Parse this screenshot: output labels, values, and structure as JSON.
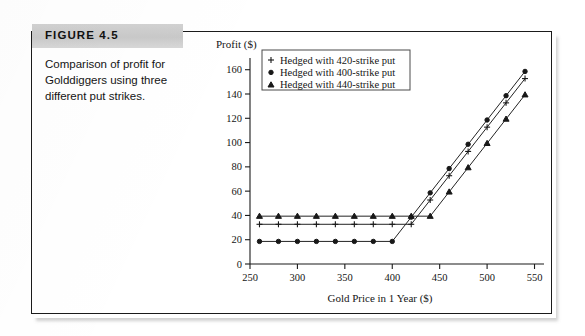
{
  "figure": {
    "number_label": "FIGURE 4.5",
    "caption": "Comparison of profit for Golddiggers using three different put strikes."
  },
  "chart_data": {
    "type": "line",
    "title": "",
    "ylabel": "Profit ($)",
    "xlabel": "Gold Price in 1 Year ($)",
    "xlim": [
      250,
      560
    ],
    "ylim": [
      0,
      168
    ],
    "xticks": [
      250,
      300,
      350,
      400,
      450,
      500,
      550
    ],
    "yticks": [
      0,
      20,
      40,
      60,
      80,
      100,
      120,
      140,
      160
    ],
    "xtick_labels": [
      "250",
      "300",
      "350",
      "400",
      "450",
      "500",
      "550"
    ],
    "ytick_labels": [
      "0",
      "20",
      "40",
      "60",
      "80",
      "100",
      "120",
      "140",
      "160"
    ],
    "grid": false,
    "legend_position": "upper-left",
    "x": [
      260,
      280,
      300,
      320,
      340,
      360,
      380,
      400,
      420,
      440,
      460,
      480,
      500,
      520,
      540
    ],
    "series": [
      {
        "name": "Hedged with 420-strike put",
        "marker": "plus",
        "values": [
          32.7,
          32.7,
          32.7,
          32.7,
          32.7,
          32.7,
          32.7,
          32.7,
          32.7,
          52.7,
          72.7,
          92.7,
          112.7,
          132.7,
          152.7
        ]
      },
      {
        "name": "Hedged with 400-strike put",
        "marker": "dot",
        "values": [
          18.6,
          18.6,
          18.6,
          18.6,
          18.6,
          18.6,
          18.6,
          18.6,
          38.6,
          58.6,
          78.6,
          98.6,
          118.6,
          138.6,
          158.6
        ]
      },
      {
        "name": "Hedged with 440-strike put",
        "marker": "triangle",
        "values": [
          39.4,
          39.4,
          39.4,
          39.4,
          39.4,
          39.4,
          39.4,
          39.4,
          39.4,
          39.4,
          59.4,
          79.4,
          99.4,
          119.4,
          139.4
        ]
      }
    ],
    "legend": [
      {
        "label": "Hedged with 420-strike put",
        "marker": "plus"
      },
      {
        "label": "Hedged with 400-strike put",
        "marker": "dot"
      },
      {
        "label": "Hedged with 440-strike put",
        "marker": "triangle"
      }
    ],
    "colors": {
      "line": "#232323",
      "marker": "#181818",
      "axis": "#1b1b1b"
    }
  }
}
